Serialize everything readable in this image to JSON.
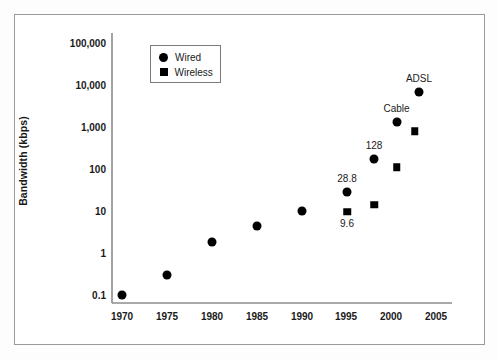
{
  "chart_data": {
    "type": "scatter",
    "title": "",
    "xlabel": "",
    "ylabel": "Bandwidth (kbps)",
    "xlim": [
      1968,
      2006
    ],
    "ylim": [
      0.1,
      100000
    ],
    "yscale": "log",
    "grid": false,
    "legend_position": "upper-left-inside",
    "x_ticks": [
      "1970",
      "1975",
      "1980",
      "1985",
      "1990",
      "1995",
      "2000",
      "2005"
    ],
    "x_tick_values": [
      1970,
      1975,
      1980,
      1985,
      1990,
      1995,
      2000,
      2005
    ],
    "y_ticks": [
      "100,000",
      "10,000",
      "1,000",
      "100",
      "10",
      "1",
      "0.1"
    ],
    "y_tick_values": [
      100000,
      10000,
      1000,
      100,
      10,
      1,
      0.1
    ],
    "legend": [
      {
        "name": "Wired",
        "marker": "circle"
      },
      {
        "name": "Wireless",
        "marker": "square"
      }
    ],
    "series": [
      {
        "name": "Wired",
        "marker": "circle",
        "points": [
          {
            "x": 1970,
            "y": 0.1,
            "label": ""
          },
          {
            "x": 1975,
            "y": 0.3,
            "label": ""
          },
          {
            "x": 1980,
            "y": 1.8,
            "label": ""
          },
          {
            "x": 1985,
            "y": 4.5,
            "label": ""
          },
          {
            "x": 1990,
            "y": 10,
            "label": ""
          },
          {
            "x": 1995,
            "y": 28.8,
            "label": "28.8"
          },
          {
            "x": 1998,
            "y": 170,
            "label": "128"
          },
          {
            "x": 2000.5,
            "y": 1300,
            "label": "Cable"
          },
          {
            "x": 2003,
            "y": 7000,
            "label": "ADSL"
          }
        ]
      },
      {
        "name": "Wireless",
        "marker": "square",
        "points": [
          {
            "x": 1995,
            "y": 9.6,
            "label": "9.6"
          },
          {
            "x": 1998,
            "y": 14,
            "label": ""
          },
          {
            "x": 2000.5,
            "y": 110,
            "label": ""
          },
          {
            "x": 2002.5,
            "y": 800,
            "label": ""
          }
        ]
      }
    ],
    "annotations": [
      {
        "text": "ADSL",
        "x": 2003,
        "y": 7000,
        "position": "above"
      },
      {
        "text": "Cable",
        "x": 2000.5,
        "y": 1300,
        "position": "above"
      },
      {
        "text": "128",
        "x": 1998,
        "y": 170,
        "position": "above"
      },
      {
        "text": "28.8",
        "x": 1995,
        "y": 28.8,
        "position": "above"
      },
      {
        "text": "9.6",
        "x": 1995,
        "y": 9.6,
        "position": "below"
      }
    ]
  }
}
